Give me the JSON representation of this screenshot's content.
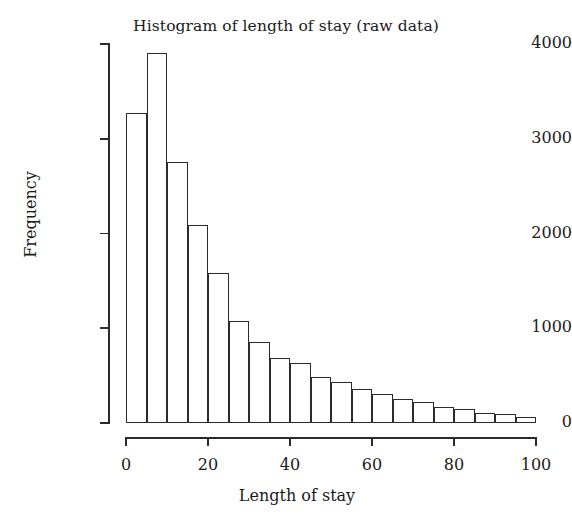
{
  "chart_data": {
    "type": "bar",
    "title": "Histogram of length of stay (raw data)",
    "xlabel": "Length of stay",
    "ylabel": "Frequency",
    "xlim": [
      0,
      100
    ],
    "ylim": [
      0,
      4000
    ],
    "grid": false,
    "legend": null,
    "bin_width": 5,
    "bin_edges": [
      0,
      5,
      10,
      15,
      20,
      25,
      30,
      35,
      40,
      45,
      50,
      55,
      60,
      65,
      70,
      75,
      80,
      85,
      90,
      95,
      100
    ],
    "categories": [
      "0-5",
      "5-10",
      "10-15",
      "15-20",
      "20-25",
      "25-30",
      "30-35",
      "35-40",
      "40-45",
      "45-50",
      "50-55",
      "55-60",
      "60-65",
      "65-70",
      "70-75",
      "75-80",
      "80-85",
      "85-90",
      "90-95",
      "95-100"
    ],
    "values": [
      3270,
      3900,
      2760,
      2090,
      1580,
      1080,
      850,
      690,
      630,
      490,
      430,
      360,
      310,
      250,
      220,
      170,
      150,
      110,
      90,
      60
    ],
    "xticks": [
      0,
      20,
      40,
      60,
      80,
      100
    ],
    "xtick_labels": [
      "0",
      "20",
      "40",
      "60",
      "80",
      "100"
    ],
    "yticks": [
      0,
      1000,
      2000,
      3000,
      4000
    ],
    "ytick_labels": [
      "0",
      "1000",
      "2000",
      "3000",
      "4000"
    ],
    "bar_edge_color": "#2b2b2b",
    "bar_fill_color": "#ffffff",
    "axis_color": "#2b2b2b",
    "background_color": "#ffffff"
  }
}
